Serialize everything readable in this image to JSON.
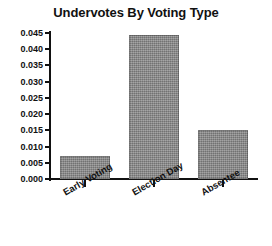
{
  "chart_data": {
    "type": "bar",
    "title": "Undervotes By Voting Type",
    "xlabel": "",
    "ylabel": "",
    "categories": [
      "Early Voting",
      "Election Day",
      "Absentee"
    ],
    "values": [
      0.007,
      0.0445,
      0.015
    ],
    "ylim": [
      0.0,
      0.045
    ],
    "ytick_step": 0.005,
    "ytick_labels": [
      "0.000",
      "0.005",
      "0.010",
      "0.015",
      "0.020",
      "0.025",
      "0.030",
      "0.035",
      "0.040",
      "0.045"
    ],
    "ytick_values": [
      0.0,
      0.005,
      0.01,
      0.015,
      0.02,
      0.025,
      0.03,
      0.035,
      0.04,
      0.045
    ],
    "grid": false,
    "legend": false,
    "bar_color": "#8c8c8c",
    "axis_color": "#111111",
    "background": "#ffffff"
  }
}
